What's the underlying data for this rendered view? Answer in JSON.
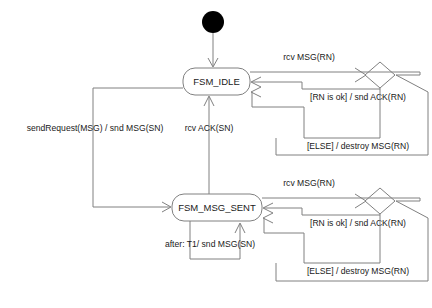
{
  "diagram": {
    "type": "uml-state-machine",
    "colors": {
      "background": "#ffffff",
      "line": "#808080",
      "text": "#1a1a1a",
      "initial_node": "#000000"
    },
    "initial_node": {
      "name": "initial-pseudostate",
      "cx": 213,
      "cy": 22,
      "r": 11
    },
    "states": [
      {
        "id": "fsm_idle",
        "label": "FSM_IDLE",
        "x": 183,
        "y": 68,
        "width": 67,
        "height": 27,
        "rx": 12
      },
      {
        "id": "fsm_msg_sent",
        "label": "FSM_MSG_SENT",
        "x": 172,
        "y": 194,
        "width": 90,
        "height": 27,
        "rx": 12
      }
    ],
    "decisions": [
      {
        "id": "decision_top",
        "cx": 380,
        "cy": 75,
        "rx": 15,
        "ry": 13
      },
      {
        "id": "decision_bottom",
        "cx": 380,
        "cy": 201,
        "rx": 15,
        "ry": 13
      }
    ],
    "transitions": [
      {
        "id": "t_init",
        "label": "",
        "from": "initial-pseudostate",
        "to": "fsm_idle"
      },
      {
        "id": "t_send_request",
        "label": "sendRequest(MSG) / snd MSG(SN)",
        "from": "fsm_idle",
        "to": "fsm_msg_sent",
        "label_x": 95,
        "label_y": 129
      },
      {
        "id": "t_rcv_ack",
        "label": "rcv ACK(SN)",
        "from": "fsm_msg_sent",
        "to": "fsm_idle",
        "label_x": 209,
        "label_y": 129
      },
      {
        "id": "t_rcv_msg_top",
        "label": "rcv MSG(RN)",
        "from": "fsm_idle",
        "to": "decision_top",
        "label_x": 309,
        "label_y": 58
      },
      {
        "id": "t_rn_ok_top",
        "label": "[RN is ok] / snd ACK(RN)",
        "from": "decision_top",
        "to": "fsm_idle",
        "label_x": 358,
        "label_y": 98
      },
      {
        "id": "t_else_top",
        "label": "[ELSE] / destroy MSG(RN)",
        "from": "decision_top",
        "to": "fsm_idle",
        "label_x": 358,
        "label_y": 147
      },
      {
        "id": "t_rcv_msg_bottom",
        "label": "rcv MSG(RN)",
        "from": "fsm_msg_sent",
        "to": "decision_bottom",
        "label_x": 309,
        "label_y": 184
      },
      {
        "id": "t_rn_ok_bottom",
        "label": "[RN is ok] / snd ACK(RN)",
        "from": "decision_bottom",
        "to": "fsm_msg_sent",
        "label_x": 358,
        "label_y": 224
      },
      {
        "id": "t_else_bottom",
        "label": "[ELSE] / destroy MSG(RN)",
        "from": "decision_bottom",
        "to": "fsm_msg_sent",
        "label_x": 358,
        "label_y": 272
      },
      {
        "id": "t_timeout_self",
        "label": "after: T1/ snd MSG(SN)",
        "from": "fsm_msg_sent",
        "to": "fsm_msg_sent",
        "label_x": 210,
        "label_y": 245
      }
    ]
  }
}
